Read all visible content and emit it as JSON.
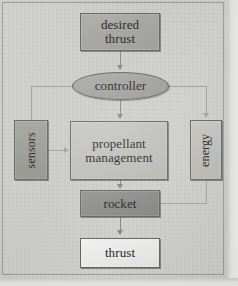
{
  "diagram": {
    "type": "block-diagram",
    "orientation": "top-to-bottom",
    "background_color": "#c9c9c6",
    "line_color": "#7d7d7a",
    "nodes": [
      {
        "id": "desired-thrust",
        "label": "desired\nthrust",
        "line1": "desired",
        "line2": "thrust",
        "shape": "rectangle",
        "fill": "#9d9d99",
        "x": 80,
        "y": 13,
        "w": 80,
        "h": 38,
        "orient": "horizontal"
      },
      {
        "id": "controller",
        "label": "controller",
        "line1": "controller",
        "line2": "",
        "shape": "ellipse",
        "fill": "#9a9a96",
        "x": 72,
        "y": 72,
        "w": 97,
        "h": 28,
        "orient": "horizontal"
      },
      {
        "id": "sensors",
        "label": "sensors",
        "line1": "sensors",
        "line2": "",
        "shape": "rectangle",
        "fill": "#949490",
        "x": 14,
        "y": 120,
        "w": 34,
        "h": 60,
        "orient": "vertical"
      },
      {
        "id": "propellant-management",
        "label": "propellant\nmanagement",
        "line1": "propellant",
        "line2": "management",
        "shape": "rectangle",
        "fill": "#b9b9b5",
        "x": 70,
        "y": 121,
        "w": 98,
        "h": 59,
        "orient": "horizontal"
      },
      {
        "id": "energy",
        "label": "energy",
        "line1": "energy",
        "line2": "",
        "shape": "rectangle",
        "fill": "#b7b7b3",
        "x": 190,
        "y": 120,
        "w": 32,
        "h": 60,
        "orient": "vertical"
      },
      {
        "id": "rocket",
        "label": "rocket",
        "line1": "rocket",
        "line2": "",
        "shape": "rectangle",
        "fill": "#838380",
        "x": 80,
        "y": 190,
        "w": 80,
        "h": 27,
        "orient": "horizontal"
      },
      {
        "id": "thrust",
        "label": "thrust",
        "line1": "thrust",
        "line2": "",
        "shape": "rectangle",
        "fill": "#e6e6e4",
        "x": 80,
        "y": 238,
        "w": 80,
        "h": 30,
        "orient": "horizontal"
      }
    ],
    "edges": [
      {
        "id": "e1",
        "from": "desired-thrust",
        "to": "controller",
        "style": "arrow",
        "routing": "straight-down"
      },
      {
        "id": "e2",
        "from": "controller",
        "to": "propellant-management",
        "style": "arrow",
        "routing": "straight-down"
      },
      {
        "id": "e3",
        "from": "controller",
        "to": "energy",
        "style": "arrow",
        "routing": "right-then-down"
      },
      {
        "id": "e4",
        "from": "sensors",
        "to": "controller",
        "style": "line",
        "routing": "up-then-right"
      },
      {
        "id": "e5",
        "from": "sensors",
        "to": "propellant-management",
        "style": "arrow",
        "routing": "straight-right"
      },
      {
        "id": "e6",
        "from": "propellant-management",
        "to": "rocket",
        "style": "arrow",
        "routing": "straight-down"
      },
      {
        "id": "e7",
        "from": "energy",
        "to": "rocket",
        "style": "line",
        "routing": "down-then-left"
      },
      {
        "id": "e8",
        "from": "rocket",
        "to": "thrust",
        "style": "arrow",
        "routing": "straight-down"
      }
    ]
  }
}
